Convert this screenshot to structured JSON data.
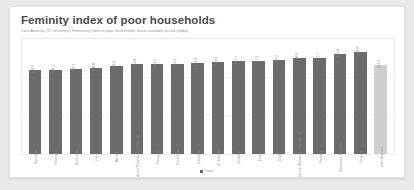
{
  "card": {
    "title": "Feminity index of poor households",
    "subtitle": "Latin America (17 countries). Femininity index in poor households, latest available period (index)",
    "corner_note": "",
    "accent_color": "#6b6b6b",
    "muted_color": "#cfcfcf",
    "background": "#ffffff",
    "page_background": "#e9e9e9"
  },
  "legend": {
    "items": [
      {
        "label": "Index",
        "color": "#6b6b6b",
        "marker": "square-marker"
      }
    ]
  },
  "chart_data": {
    "type": "bar",
    "title": "Feminity index of poor households",
    "subtitle": "Latin America (17 countries). Femininity index in poor households, latest available period (index)",
    "xlabel": "",
    "ylabel": "Index",
    "ylim": [
      0,
      140
    ],
    "grid": true,
    "legend_position": "bottom",
    "categories": [
      "Honduras",
      "Nicaragua",
      "Guatemala",
      "Peru",
      "Mexico",
      "Bolivia (Plurinational State of)",
      "Paraguay",
      "Costa Rica",
      "Colombia",
      "El Salvador",
      "Ecuador",
      "Brazil",
      "Chile",
      "Venezuela (Bolivarian Republic of)",
      "Panama",
      "Dominican Republic",
      "Uruguay",
      "Latin America"
    ],
    "values": [
      105.6,
      106.1,
      107.3,
      108.0,
      110.4,
      113.0,
      113.2,
      113.5,
      114.3,
      116.4,
      117.1,
      117.3,
      119.2,
      120.9,
      121.7,
      125.8,
      128.4,
      112.9
    ],
    "value_labels": [
      "105.6",
      "106.1",
      "107.3",
      "108.0",
      "110.4",
      "113.0",
      "113.2",
      "113.5",
      "114.3",
      "116.4",
      "117.1",
      "117.3",
      "119.2",
      "120.9",
      "121.7",
      "125.8",
      "128.4",
      "112.9"
    ],
    "highlight_index": 17,
    "series": [
      {
        "name": "Index",
        "color": "#6b6b6b"
      }
    ]
  }
}
